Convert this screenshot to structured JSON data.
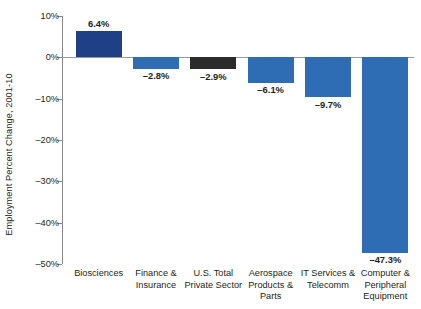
{
  "chart_data": {
    "type": "bar",
    "title": "",
    "xlabel": "",
    "ylabel": "Employment Percent Change, 2001-10",
    "ylim": [
      -50,
      10
    ],
    "yticks": [
      10,
      0,
      -10,
      -20,
      -30,
      -40,
      -50
    ],
    "ytick_labels": [
      "10%",
      "0%",
      "–10%",
      "–20%",
      "–30%",
      "–40%",
      "–50%"
    ],
    "grid": false,
    "legend": "none",
    "categories": [
      "Biosciences",
      "Finance &\nInsurance",
      "U.S. Total\nPrivate Sector",
      "Aerospace\nProducts &\nParts",
      "IT Services &\nTelecomm",
      "Computer &\nPeripheral\nEquipment"
    ],
    "values": [
      6.4,
      -2.8,
      -2.9,
      -6.1,
      -9.7,
      -47.3
    ],
    "data_labels": [
      "6.4%",
      "–2.8%",
      "–2.9%",
      "–6.1%",
      "–9.7%",
      "–47.3%"
    ],
    "bar_colors": [
      "#1F3F87",
      "#2E6DB4",
      "#2B2B2B",
      "#2E6DB4",
      "#2E6DB4",
      "#2E6DB4"
    ]
  },
  "categories_lines": [
    [
      "Biosciences"
    ],
    [
      "Finance &",
      "Insurance"
    ],
    [
      "U.S. Total",
      "Private Sector"
    ],
    [
      "Aerospace",
      "Products &",
      "Parts"
    ],
    [
      "IT Services &",
      "Telecomm"
    ],
    [
      "Computer &",
      "Peripheral",
      "Equipment"
    ]
  ],
  "colors": {
    "axis": "#8a8a8a",
    "zero_line": "#9a9a9a",
    "text": "#231f20",
    "background": "#ffffff",
    "bar_primary": "#2E6DB4",
    "bar_highlight": "#1F3F87",
    "bar_total": "#2B2B2B"
  }
}
